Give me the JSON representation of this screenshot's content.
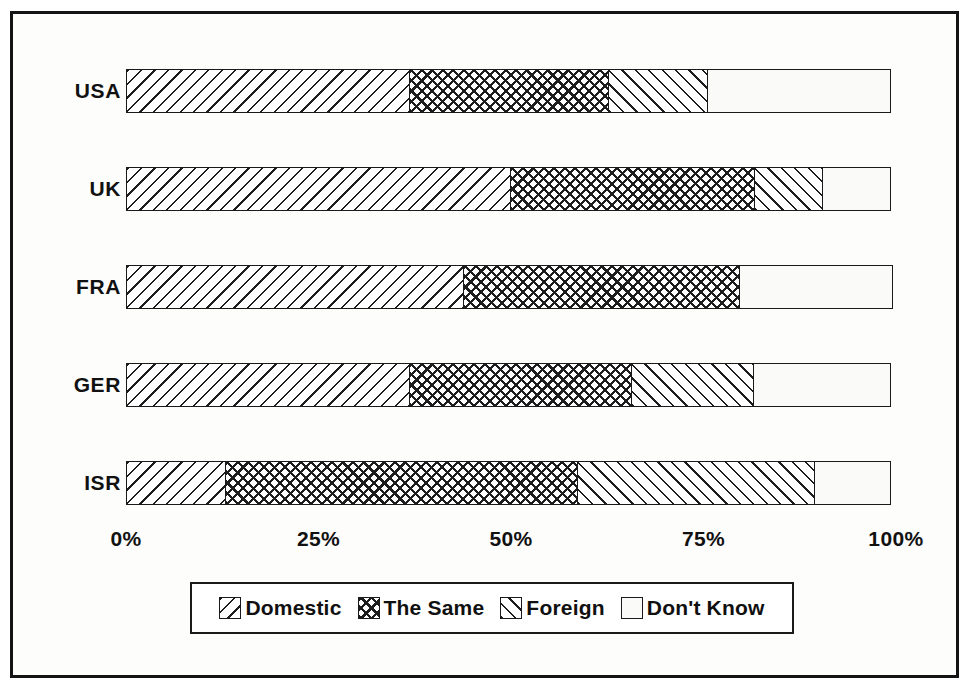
{
  "chart_data": {
    "type": "bar",
    "orientation": "horizontal",
    "stacked": true,
    "normalized": true,
    "title": "",
    "subtitle": "",
    "xlabel": "",
    "ylabel": "",
    "xlim": [
      0,
      100
    ],
    "grid": false,
    "legend_position": "bottom",
    "categories": [
      "USA",
      "UK",
      "FRA",
      "GER",
      "ISR"
    ],
    "tick_labels": [
      "0%",
      "25%",
      "50%",
      "75%",
      "100%"
    ],
    "tick_values": [
      0,
      25,
      50,
      75,
      100
    ],
    "series": [
      {
        "name": "Domestic",
        "pattern": "backslash-hatch",
        "values": [
          37,
          50,
          44,
          37,
          13
        ]
      },
      {
        "name": "The Same",
        "pattern": "cross-hatch",
        "values": [
          26,
          32,
          36,
          29,
          46
        ]
      },
      {
        "name": "Foreign",
        "pattern": "forwardslash-hatch",
        "values": [
          13,
          9,
          0,
          16,
          31
        ]
      },
      {
        "name": "Don't Know",
        "pattern": "blank",
        "values": [
          24,
          9,
          20,
          18,
          10
        ]
      }
    ]
  },
  "legend": {
    "items": [
      {
        "label": "Domestic"
      },
      {
        "label": "The Same"
      },
      {
        "label": "Foreign"
      },
      {
        "label": "Don't Know"
      }
    ]
  },
  "colors": {
    "ink": "#1a1a1a",
    "background": "#ffffff",
    "frame": "#141414"
  }
}
